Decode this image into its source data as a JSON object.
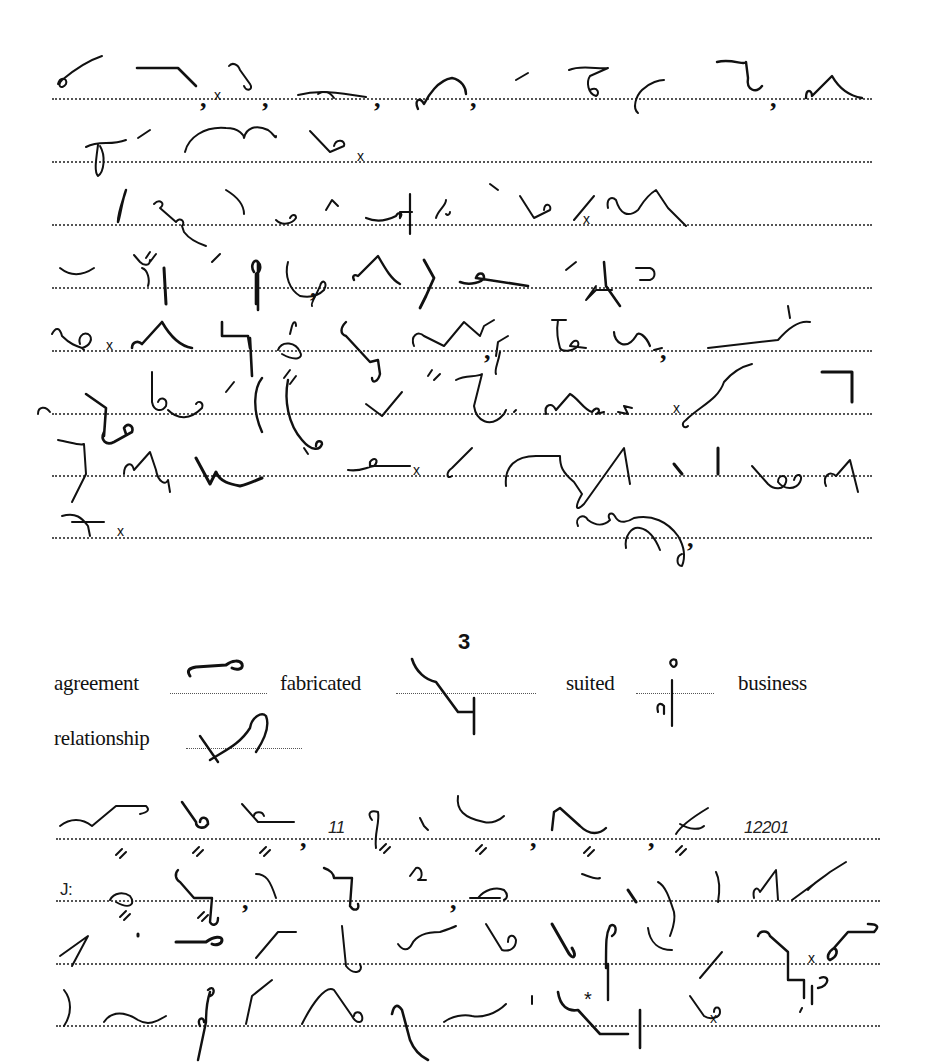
{
  "document": {
    "type": "shorthand-exercise-page",
    "passage_2_lines": 8,
    "section": {
      "heading": "3",
      "key_words": [
        {
          "word": "agreement"
        },
        {
          "word": "fabricated"
        },
        {
          "word": "suited"
        },
        {
          "word": "business"
        },
        {
          "word": "relationship"
        }
      ],
      "passage_lines": 4
    },
    "inline_text": {
      "number_1": "11",
      "number_2": "12201",
      "colon_mark": "J:",
      "asterisk": "*"
    },
    "marks": {
      "cross": "x",
      "comma": ","
    }
  }
}
